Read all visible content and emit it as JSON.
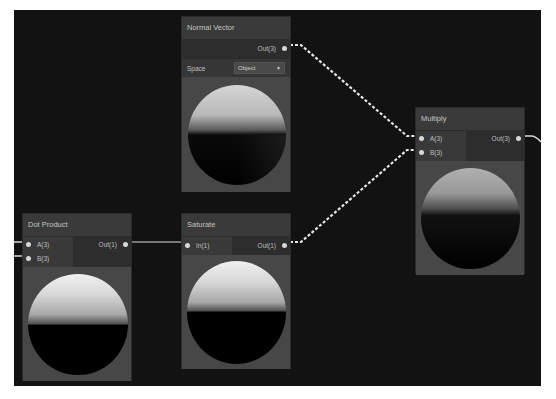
{
  "graph": {
    "nodes": {
      "normal_vector": {
        "title": "Normal Vector",
        "outputs": [
          "Out(3)"
        ],
        "setting_label": "Space",
        "setting_value": "Object",
        "dropdown_icon": "triangle-down-icon"
      },
      "multiply": {
        "title": "Multiply",
        "inputs": [
          "A(3)",
          "B(3)"
        ],
        "outputs": [
          "Out(3)"
        ]
      },
      "dot_product": {
        "title": "Dot Product",
        "inputs": [
          "A(3)",
          "B(3)"
        ],
        "outputs": [
          "Out(1)"
        ]
      },
      "saturate": {
        "title": "Saturate",
        "inputs": [
          "In(1)"
        ],
        "outputs": [
          "Out(1)"
        ]
      }
    },
    "colors": {
      "canvas": "#121212",
      "node_body": "#3a3a3a",
      "preview_bg": "#474747",
      "edge_vector": "#e6e6e6",
      "edge_scalar": "#9a9a9a"
    }
  }
}
